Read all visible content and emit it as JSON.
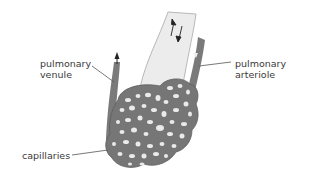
{
  "labels": {
    "venule_line1": "pulmonary",
    "venule_line2": "venule",
    "arteriole_line1": "pulmonary",
    "arteriole_line2": "arteriole",
    "capillaries": "capillaries"
  },
  "colors": {
    "vessel": "#7a7a7a",
    "vessel_dark": "#5e5e5e",
    "airway": "#ececec",
    "airway_edge": "#b5b5b5",
    "hole": "#ededed",
    "text": "#3a3a3a",
    "leader": "#555555"
  }
}
